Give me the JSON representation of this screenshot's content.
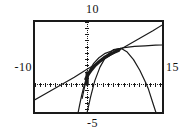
{
  "screen": {
    "kind": "graphing-calculator-viewport",
    "background_color": "#ffffff",
    "ink_color": "#1a1a1a",
    "width_px": 185,
    "height_px": 134
  },
  "window_labels": {
    "ymax": "10",
    "ymin": "-5",
    "xmin": "-10",
    "xmax": "15"
  },
  "chart_data": {
    "type": "line",
    "title": "",
    "xlabel": "",
    "ylabel": "",
    "xlim": [
      -10,
      15
    ],
    "ylim": [
      -5,
      10
    ],
    "grid": false,
    "legend": "none",
    "axes": {
      "x_axis_style": "dotted",
      "y_axis_style": "dotted",
      "x_axis_y_value": 0,
      "y_axis_x_value": 0,
      "tick_spacing_x": 1,
      "tick_spacing_y": 1,
      "tick_style": "dotted-marks"
    },
    "series": [
      {
        "name": "line",
        "style": "thin-solid",
        "points": [
          [
            -10,
            -2.4
          ],
          [
            -7.5,
            -1.2
          ],
          [
            -5.0,
            0.0
          ],
          [
            -2.5,
            1.2
          ],
          [
            0.0,
            2.5
          ],
          [
            2.5,
            3.7
          ],
          [
            5.0,
            5.0
          ],
          [
            7.5,
            6.2
          ],
          [
            10.0,
            7.4
          ],
          [
            12.5,
            8.6
          ],
          [
            15.0,
            9.9
          ]
        ]
      },
      {
        "name": "downward-parabola",
        "style": "thin-solid",
        "points": [
          [
            -0.2,
            -5.0
          ],
          [
            0.6,
            -2.0
          ],
          [
            1.4,
            0.6
          ],
          [
            2.4,
            2.8
          ],
          [
            3.6,
            4.6
          ],
          [
            5.0,
            5.6
          ],
          [
            6.4,
            5.8
          ],
          [
            7.6,
            5.2
          ],
          [
            8.8,
            4.0
          ],
          [
            10.0,
            2.3
          ],
          [
            11.2,
            0.2
          ],
          [
            11.6,
            -0.6
          ],
          [
            12.6,
            -3.2
          ],
          [
            13.3,
            -5.0
          ]
        ]
      },
      {
        "name": "flattening-curve",
        "style": "thin-solid",
        "points": [
          [
            -1.0,
            -2.2
          ],
          [
            -0.6,
            -0.6
          ],
          [
            -0.2,
            0.9
          ],
          [
            0.4,
            2.3
          ],
          [
            1.2,
            3.4
          ],
          [
            2.2,
            4.3
          ],
          [
            3.4,
            5.0
          ],
          [
            5.0,
            5.5
          ],
          [
            7.0,
            5.9
          ],
          [
            9.0,
            6.1
          ],
          [
            11.0,
            6.2
          ],
          [
            13.0,
            6.3
          ],
          [
            15.0,
            6.35
          ]
        ]
      },
      {
        "name": "overlap-bold-segment",
        "style": "thick-solid",
        "points": [
          [
            -0.3,
            0.9
          ],
          [
            0.2,
            1.7
          ],
          [
            0.8,
            2.4
          ],
          [
            1.5,
            3.1
          ],
          [
            2.3,
            3.7
          ],
          [
            3.2,
            4.3
          ],
          [
            4.2,
            4.8
          ],
          [
            5.2,
            5.2
          ],
          [
            6.0,
            5.5
          ]
        ]
      },
      {
        "name": "steep-left-branch",
        "style": "thin-solid",
        "points": [
          [
            -1.9,
            -5.0
          ],
          [
            -1.5,
            -3.3
          ],
          [
            -1.1,
            -1.7
          ],
          [
            -0.7,
            -0.4
          ],
          [
            -0.35,
            0.6
          ],
          [
            -0.1,
            1.4
          ],
          [
            0.1,
            2.0
          ]
        ]
      },
      {
        "name": "vertical-stub",
        "style": "thick-solid",
        "points": [
          [
            -0.05,
            0.05
          ],
          [
            -0.05,
            1.0
          ],
          [
            -0.05,
            1.9
          ]
        ]
      }
    ]
  }
}
